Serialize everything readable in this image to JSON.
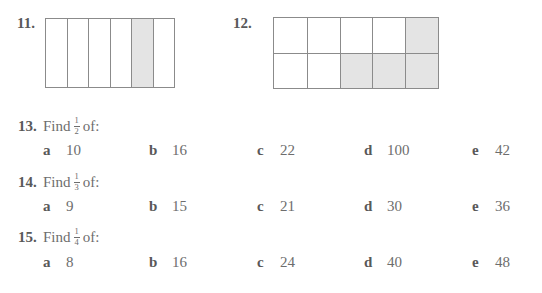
{
  "colors": {
    "page_bg": "#ffffff",
    "text": "#6d6d6d",
    "bold_text": "#595959",
    "figure_border": "#8b8b8b",
    "shaded_fill": "#e4e4e4"
  },
  "figures": [
    {
      "label": "11.",
      "type": "strip",
      "columns": 6,
      "rows": 1,
      "shaded_indices": [
        4
      ]
    },
    {
      "label": "12.",
      "type": "grid",
      "columns": 5,
      "rows": 2,
      "shaded_indices": [
        4,
        7,
        8,
        9
      ]
    }
  ],
  "questions": [
    {
      "number": "13.",
      "find_label": "Find",
      "fraction": {
        "num": "1",
        "den": "2"
      },
      "of_label": "of:",
      "options": [
        {
          "letter": "a",
          "value": "10"
        },
        {
          "letter": "b",
          "value": "16"
        },
        {
          "letter": "c",
          "value": "22"
        },
        {
          "letter": "d",
          "value": "100"
        },
        {
          "letter": "e",
          "value": "42"
        }
      ]
    },
    {
      "number": "14.",
      "find_label": "Find",
      "fraction": {
        "num": "1",
        "den": "3"
      },
      "of_label": "of:",
      "options": [
        {
          "letter": "a",
          "value": "9"
        },
        {
          "letter": "b",
          "value": "15"
        },
        {
          "letter": "c",
          "value": "21"
        },
        {
          "letter": "d",
          "value": "30"
        },
        {
          "letter": "e",
          "value": "36"
        }
      ]
    },
    {
      "number": "15.",
      "find_label": "Find",
      "fraction": {
        "num": "1",
        "den": "4"
      },
      "of_label": "of:",
      "options": [
        {
          "letter": "a",
          "value": "8"
        },
        {
          "letter": "b",
          "value": "16"
        },
        {
          "letter": "c",
          "value": "24"
        },
        {
          "letter": "d",
          "value": "40"
        },
        {
          "letter": "e",
          "value": "48"
        }
      ]
    }
  ]
}
